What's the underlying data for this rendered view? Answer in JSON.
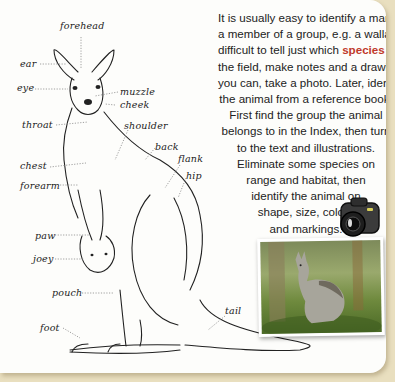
{
  "paragraph": {
    "lines": [
      "It is usually easy to identify a mammal as",
      "a member of a group, e.g. a wallaby, but",
      "difficult to tell just which",
      "species",
      "it is. In",
      "the field, make notes and a drawing. If",
      "you can, take a photo. Later, identify",
      "the animal from a reference book.",
      "First find the group the animal",
      "belongs to in the Index, then turn",
      "to the text and illustrations.",
      "Eliminate some species on",
      "range and habitat, then",
      "identify the animal on",
      "shape, size, colour",
      "and markings."
    ],
    "highlight_color": "#c0392b"
  },
  "diagram": {
    "labels": {
      "forehead": "forehead",
      "ear": "ear",
      "eye": "eye",
      "muzzle": "muzzle",
      "cheek": "cheek",
      "throat": "throat",
      "shoulder": "shoulder",
      "back": "back",
      "flank": "flank",
      "hip": "hip",
      "chest": "chest",
      "forearm": "forearm",
      "paw": "paw",
      "joey": "joey",
      "pouch": "pouch",
      "foot": "foot",
      "tail": "tail"
    }
  },
  "colors": {
    "background": "#e9dfbf",
    "page": "#fdfdfb",
    "text": "#222222"
  }
}
